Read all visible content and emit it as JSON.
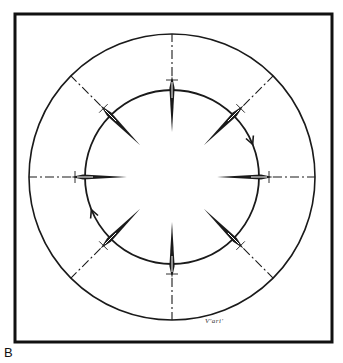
{
  "figure": {
    "panel_label": "B",
    "signature": "V'ari'",
    "frame": {
      "x": 15,
      "y": 14,
      "width": 317,
      "height": 328,
      "stroke": "#111111",
      "stroke_width": 3
    },
    "center": {
      "x": 172,
      "y": 177
    },
    "outer_circle": {
      "r": 143,
      "stroke": "#1a1a1a",
      "stroke_width": 1.6
    },
    "inner_circle": {
      "r": 87,
      "stroke": "#1a1a1a",
      "stroke_width": 1.8
    },
    "radial_lines": [
      {
        "angle": -90,
        "name": "radial-line-top"
      },
      {
        "angle": -45,
        "name": "radial-line-top-right"
      },
      {
        "angle": 0,
        "name": "radial-line-right"
      },
      {
        "angle": 45,
        "name": "radial-line-bottom-right"
      },
      {
        "angle": 90,
        "name": "radial-line-bottom"
      },
      {
        "angle": 135,
        "name": "radial-line-bottom-left"
      },
      {
        "angle": 180,
        "name": "radial-line-left"
      },
      {
        "angle": 225,
        "name": "radial-line-top-left"
      }
    ],
    "radial_line_inner_start": 45,
    "tick_radius": 97,
    "arrows": [
      {
        "name": "clockwise-arrow-right",
        "angle": -22,
        "direction": "clockwise"
      },
      {
        "name": "clockwise-arrow-left",
        "angle": 158,
        "direction": "clockwise"
      }
    ]
  }
}
